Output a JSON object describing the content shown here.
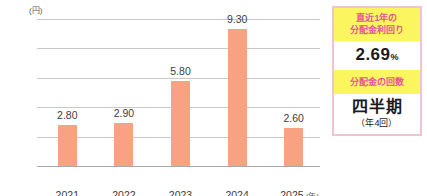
{
  "chart_data": {
    "type": "bar",
    "title": "",
    "xlabel": "年",
    "ylabel": "(円)",
    "categories": [
      "2021",
      "2022",
      "2023",
      "2024",
      "2025"
    ],
    "values": [
      2.8,
      2.9,
      5.8,
      9.3,
      2.6
    ],
    "value_labels": [
      "2.80",
      "2.90",
      "5.80",
      "9.30",
      "2.60"
    ],
    "ylim": [
      0.0,
      10.0
    ],
    "yticks": [
      "0.00",
      "2.00",
      "4.00",
      "6.00",
      "8.00",
      "10.00"
    ],
    "ytick_values": [
      0,
      2,
      4,
      6,
      8,
      10
    ],
    "grid": true,
    "legend": "none",
    "bar_color": "#f8a183",
    "grid_color": "#c9c9cb",
    "axis_color": "#a8a8aa"
  },
  "axis": {
    "unit_label": "(円)",
    "x_unit_label": "(年)"
  },
  "info_panel": {
    "border_color": "#f0c2d2",
    "highlight_bg": "#fbf55f",
    "highlight_text_color": "#e3589a",
    "yield_head_line1": "直近1年の",
    "yield_head_line2": "分配金利回り",
    "yield_value": "2.69",
    "yield_unit": "%",
    "frequency_head": "分配金の回数",
    "frequency_value": "四半期",
    "frequency_sub": "（年4回）"
  }
}
